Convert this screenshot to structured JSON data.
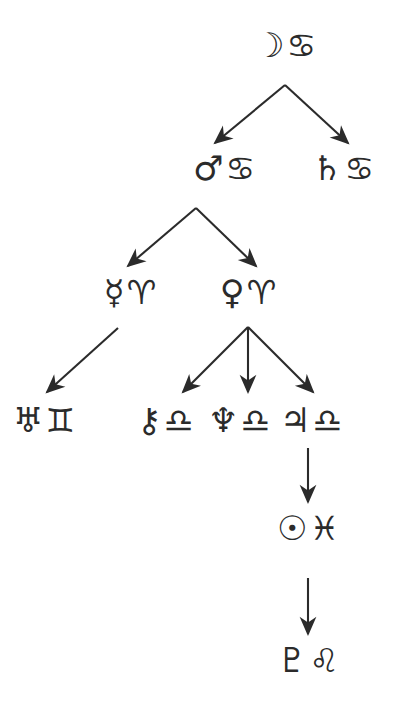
{
  "diagram": {
    "type": "tree",
    "background_color": "#ffffff",
    "ink_color": "#2b2b2b",
    "nodes": [
      {
        "id": "moon",
        "planet_name": "Moon",
        "planet_glyph": "☽",
        "sign_name": "Cancer",
        "sign_glyph": "♋",
        "label": "☽ ♋",
        "x": 285,
        "y": 45
      },
      {
        "id": "mars",
        "planet_name": "Mars",
        "planet_glyph": "♂",
        "sign_name": "Cancer",
        "sign_glyph": "♋",
        "label": "♂ ♋",
        "x": 224,
        "y": 168
      },
      {
        "id": "saturn",
        "planet_name": "Saturn",
        "planet_glyph": "♄",
        "sign_name": "Cancer",
        "sign_glyph": "♋",
        "label": "♄ ♋",
        "x": 343,
        "y": 168
      },
      {
        "id": "mercury",
        "planet_name": "Mercury",
        "planet_glyph": "☿",
        "sign_name": "Aries",
        "sign_glyph": "♈",
        "label": "☿ ♈",
        "x": 130,
        "y": 292
      },
      {
        "id": "venus",
        "planet_name": "Venus",
        "planet_glyph": "♀",
        "sign_name": "Aries",
        "sign_glyph": "♈",
        "label": "♀ ♈",
        "x": 248,
        "y": 292
      },
      {
        "id": "uranus",
        "planet_name": "Uranus",
        "planet_glyph": "♅",
        "sign_name": "Gemini",
        "sign_glyph": "♊",
        "label": "♅ ♊",
        "x": 44,
        "y": 420
      },
      {
        "id": "chiron",
        "planet_name": "Chiron",
        "planet_glyph": "⚷",
        "sign_name": "Libra",
        "sign_glyph": "♎",
        "label": "⚷ ♎",
        "x": 165,
        "y": 420
      },
      {
        "id": "neptune",
        "planet_name": "Neptune",
        "planet_glyph": "♆",
        "sign_name": "Libra",
        "sign_glyph": "♎",
        "label": "♆ ♎",
        "x": 239,
        "y": 420
      },
      {
        "id": "jupiter",
        "planet_name": "Jupiter",
        "planet_glyph": "♃",
        "sign_name": "Libra",
        "sign_glyph": "♎",
        "label": "♃ ♎",
        "x": 311,
        "y": 420
      },
      {
        "id": "sun",
        "planet_name": "Sun",
        "planet_glyph": "☉",
        "sign_name": "Pisces",
        "sign_glyph": "♓",
        "label": "☉ ♓",
        "x": 308,
        "y": 528
      },
      {
        "id": "pluto",
        "planet_name": "Pluto",
        "planet_glyph": "♇",
        "sign_name": "Leo",
        "sign_glyph": "♌",
        "label": "♇ ♌",
        "x": 308,
        "y": 660
      }
    ],
    "edges": [
      {
        "id": "edge-moon-mars",
        "from": "moon",
        "to": "mars",
        "x1": 285,
        "y1": 85,
        "x2": 215,
        "y2": 143
      },
      {
        "id": "edge-moon-saturn",
        "from": "moon",
        "to": "saturn",
        "x1": 285,
        "y1": 85,
        "x2": 348,
        "y2": 143
      },
      {
        "id": "edge-mars-mercury",
        "from": "mars",
        "to": "mercury",
        "x1": 196,
        "y1": 208,
        "x2": 128,
        "y2": 266
      },
      {
        "id": "edge-mars-venus",
        "from": "mars",
        "to": "venus",
        "x1": 196,
        "y1": 208,
        "x2": 256,
        "y2": 266
      },
      {
        "id": "edge-mercury-uranus",
        "from": "mercury",
        "to": "uranus",
        "x1": 118,
        "y1": 328,
        "x2": 47,
        "y2": 392
      },
      {
        "id": "edge-venus-chiron",
        "from": "venus",
        "to": "chiron",
        "x1": 248,
        "y1": 327,
        "x2": 183,
        "y2": 392
      },
      {
        "id": "edge-venus-neptune",
        "from": "venus",
        "to": "neptune",
        "x1": 248,
        "y1": 327,
        "x2": 248,
        "y2": 392
      },
      {
        "id": "edge-venus-jupiter",
        "from": "venus",
        "to": "jupiter",
        "x1": 248,
        "y1": 327,
        "x2": 313,
        "y2": 392
      },
      {
        "id": "edge-jupiter-sun",
        "from": "jupiter",
        "to": "sun",
        "x1": 308,
        "y1": 448,
        "x2": 308,
        "y2": 502
      },
      {
        "id": "edge-sun-pluto",
        "from": "sun",
        "to": "pluto",
        "x1": 308,
        "y1": 578,
        "x2": 308,
        "y2": 634
      }
    ]
  }
}
